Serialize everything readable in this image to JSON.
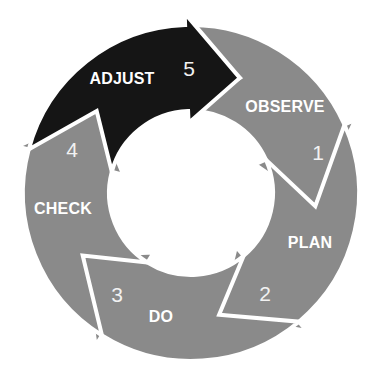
{
  "diagram": {
    "center": [
      191,
      193
    ],
    "inner_radius": 82,
    "outer_radius": 168,
    "colors": {
      "step": "#8a8a8a",
      "highlight": "#151515",
      "gap": "#ffffff",
      "text": "#ffffff"
    },
    "steps": [
      {
        "number": "1",
        "label": "OBSERVE",
        "highlighted": false,
        "start_deg": -67,
        "back_deg": -24,
        "tip_deg": 6,
        "label_pos": [
          285,
          107
        ],
        "num_pos": [
          318,
          153
        ]
      },
      {
        "number": "2",
        "label": "PLAN",
        "highlighted": false,
        "start_deg": 6,
        "back_deg": 50,
        "tip_deg": 77,
        "label_pos": [
          310,
          243
        ],
        "num_pos": [
          265,
          294
        ]
      },
      {
        "number": "3",
        "label": "DO",
        "highlighted": false,
        "start_deg": 77,
        "back_deg": 122,
        "tip_deg": 150,
        "label_pos": [
          161,
          317
        ],
        "num_pos": [
          117,
          295
        ]
      },
      {
        "number": "4",
        "label": "CHECK",
        "highlighted": false,
        "start_deg": 150,
        "back_deg": 195,
        "tip_deg": 221,
        "label_pos": [
          63,
          209
        ],
        "num_pos": [
          72,
          150
        ]
      },
      {
        "number": "5",
        "label": "ADJUST",
        "highlighted": true,
        "start_deg": 221,
        "back_deg": 268,
        "tip_deg": 293,
        "label_pos": [
          122,
          79
        ],
        "num_pos": [
          189,
          69
        ]
      }
    ]
  }
}
